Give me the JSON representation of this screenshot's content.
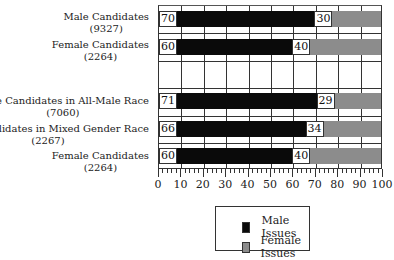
{
  "chart_data": {
    "type": "bar",
    "orientation": "horizontal",
    "stacked": true,
    "title": "",
    "xlabel": "",
    "ylabel": "",
    "xlim": [
      0,
      100
    ],
    "x_ticks": [
      "0",
      "10",
      "20",
      "30",
      "40",
      "50",
      "60",
      "70",
      "80",
      "90",
      "100"
    ],
    "grid": true,
    "legend_position": "bottom",
    "categories": [
      {
        "label": "Male Candidates",
        "n": "(9327)"
      },
      {
        "label": "Female Candidates",
        "n": "(2264)"
      },
      {
        "label": "",
        "n": ""
      },
      {
        "label": "Male Candidates in All-Male Race",
        "n": "(7060)"
      },
      {
        "label": "Male Candidates in Mixed Gender Race",
        "n": "(2267)"
      },
      {
        "label": "Female Candidates",
        "n": "(2264)"
      }
    ],
    "series": [
      {
        "name": "Male Issues",
        "color": "#0a0a0a",
        "values": [
          70,
          60,
          null,
          71,
          66,
          60
        ]
      },
      {
        "name": "Female Issues",
        "color": "#8c8c8c",
        "values": [
          30,
          40,
          null,
          29,
          34,
          40
        ]
      }
    ]
  },
  "labels": {
    "r0": "Male Candidates",
    "r0n": "(9327)",
    "r1": "Female Candidates",
    "r1n": "(2264)",
    "r3": "Male Candidates in All-Male Race",
    "r3n": "(7060)",
    "r4": "Male Candidates in Mixed Gender Race",
    "r4n": "(2267)",
    "r5": "Female Candidates",
    "r5n": "(2264)"
  },
  "values": {
    "r0m": "70",
    "r0f": "30",
    "r1m": "60",
    "r1f": "40",
    "r3m": "71",
    "r3f": "29",
    "r4m": "66",
    "r4f": "34",
    "r5m": "60",
    "r5f": "40"
  },
  "legend": {
    "male": "Male Issues",
    "female": "Female Issues"
  },
  "ticks": [
    "0",
    "10",
    "20",
    "30",
    "40",
    "50",
    "60",
    "70",
    "80",
    "90",
    "100"
  ]
}
